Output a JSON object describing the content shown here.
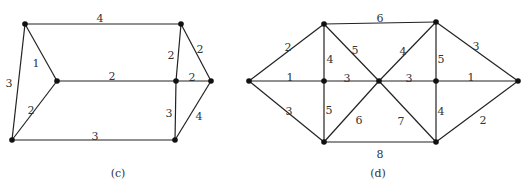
{
  "figures": [
    {
      "id": "c",
      "caption": "(c)",
      "caption_pos": [
        118,
        177
      ],
      "nodes": {
        "A": [
          25,
          24
        ],
        "B": [
          181,
          24
        ],
        "C": [
          57,
          81
        ],
        "D": [
          176,
          81
        ],
        "E": [
          211,
          81
        ],
        "F": [
          12,
          140
        ],
        "G": [
          175,
          140
        ]
      },
      "edges": [
        {
          "from": "A",
          "to": "B",
          "weight": "4",
          "label_pos": [
            100,
            19
          ]
        },
        {
          "from": "A",
          "to": "C",
          "weight": "1",
          "label_pos": [
            36,
            64
          ]
        },
        {
          "from": "A",
          "to": "F",
          "weight": "3",
          "label_pos": [
            9,
            84
          ]
        },
        {
          "from": "C",
          "to": "D",
          "weight": "2",
          "label_pos": [
            112,
            77
          ]
        },
        {
          "from": "C",
          "to": "F",
          "weight": "2",
          "label_pos": [
            31,
            111
          ]
        },
        {
          "from": "F",
          "to": "G",
          "weight": "3",
          "label_pos": [
            95,
            137
          ]
        },
        {
          "from": "B",
          "to": "D",
          "weight": "2",
          "label_pos": [
            171,
            56
          ]
        },
        {
          "from": "B",
          "to": "E",
          "weight": "2",
          "label_pos": [
            200,
            50
          ]
        },
        {
          "from": "D",
          "to": "E",
          "weight": "2",
          "label_pos": [
            192,
            78
          ]
        },
        {
          "from": "D",
          "to": "G",
          "weight": "3",
          "label_pos": [
            169,
            114
          ]
        },
        {
          "from": "E",
          "to": "G",
          "weight": "4",
          "label_pos": [
            199,
            117
          ]
        }
      ]
    },
    {
      "id": "d",
      "caption": "(d)",
      "caption_pos": [
        378,
        177
      ],
      "nodes": {
        "L": [
          249,
          81
        ],
        "T1": [
          324,
          24
        ],
        "M1": [
          324,
          81
        ],
        "B1": [
          324,
          142
        ],
        "X": [
          379,
          81
        ],
        "T2": [
          436,
          22
        ],
        "M2": [
          436,
          81
        ],
        "B2": [
          436,
          142
        ],
        "R": [
          518,
          81
        ]
      },
      "edges": [
        {
          "from": "L",
          "to": "T1",
          "weight": "2",
          "label_pos": [
            288,
            48
          ]
        },
        {
          "from": "L",
          "to": "M1",
          "weight": "1",
          "label_pos": [
            290,
            78
          ]
        },
        {
          "from": "L",
          "to": "B1",
          "weight": "3",
          "label_pos": [
            289,
            112
          ]
        },
        {
          "from": "T1",
          "to": "T2",
          "weight": "6",
          "label_pos": [
            380,
            19
          ]
        },
        {
          "from": "T1",
          "to": "M1",
          "weight": "4",
          "label_pos": [
            330,
            60
          ]
        },
        {
          "from": "T1",
          "to": "X",
          "weight": "5",
          "label_pos": [
            355,
            51
          ]
        },
        {
          "from": "M1",
          "to": "X",
          "weight": "3",
          "label_pos": [
            347,
            79
          ]
        },
        {
          "from": "M1",
          "to": "B1",
          "weight": "5",
          "label_pos": [
            329,
            111
          ]
        },
        {
          "from": "B1",
          "to": "X",
          "weight": "6",
          "label_pos": [
            359,
            121
          ]
        },
        {
          "from": "B1",
          "to": "B2",
          "weight": "8",
          "label_pos": [
            380,
            155
          ]
        },
        {
          "from": "X",
          "to": "T2",
          "weight": "4",
          "label_pos": [
            403,
            52
          ]
        },
        {
          "from": "X",
          "to": "M2",
          "weight": "3",
          "label_pos": [
            409,
            79
          ]
        },
        {
          "from": "X",
          "to": "B2",
          "weight": "7",
          "label_pos": [
            401,
            122
          ]
        },
        {
          "from": "T2",
          "to": "M2",
          "weight": "5",
          "label_pos": [
            441,
            60
          ]
        },
        {
          "from": "T2",
          "to": "R",
          "weight": "3",
          "label_pos": [
            476,
            47
          ]
        },
        {
          "from": "M2",
          "to": "R",
          "weight": "1",
          "label_pos": [
            471,
            78
          ]
        },
        {
          "from": "M2",
          "to": "B2",
          "weight": "4",
          "label_pos": [
            441,
            112
          ]
        },
        {
          "from": "B2",
          "to": "R",
          "weight": "2",
          "label_pos": [
            483,
            121
          ]
        }
      ]
    }
  ]
}
